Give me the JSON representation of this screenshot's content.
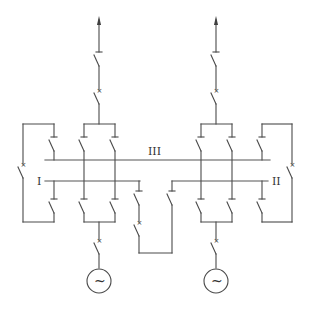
{
  "diagram": {
    "type": "electrical single-line diagram",
    "stroke_color": "#4a4a4a",
    "background": "#ffffff",
    "buses": [
      {
        "id": "bus-III",
        "label": "III"
      },
      {
        "id": "bus-I",
        "label": "I"
      },
      {
        "id": "bus-II",
        "label": "II"
      }
    ],
    "feeders": [
      {
        "id": "left-outgoing-feeder",
        "direction": "up-arrow"
      },
      {
        "id": "right-outgoing-feeder",
        "direction": "up-arrow"
      }
    ],
    "generators": [
      {
        "id": "left-generator",
        "symbol": "~"
      },
      {
        "id": "right-generator",
        "symbol": "~"
      }
    ],
    "breaker_mark": "×"
  }
}
